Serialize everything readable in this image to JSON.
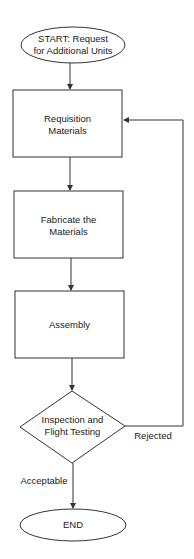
{
  "flowchart": {
    "start": {
      "label_line1": "START: Request",
      "label_line2": "for Additional Units"
    },
    "steps": [
      {
        "label_line1": "Requisition",
        "label_line2": "Materials"
      },
      {
        "label_line1": "Fabricate the",
        "label_line2": "Materials"
      },
      {
        "label_line1": "Assembly",
        "label_line2": ""
      }
    ],
    "decision": {
      "label_line1": "Inspection and",
      "label_line2": "Flight Testing"
    },
    "edges": {
      "rejected": "Rejected",
      "acceptable": "Acceptable"
    },
    "end": {
      "label": "END"
    },
    "colors": {
      "stroke": "#333333",
      "text": "#222222",
      "background": "#ffffff"
    }
  }
}
